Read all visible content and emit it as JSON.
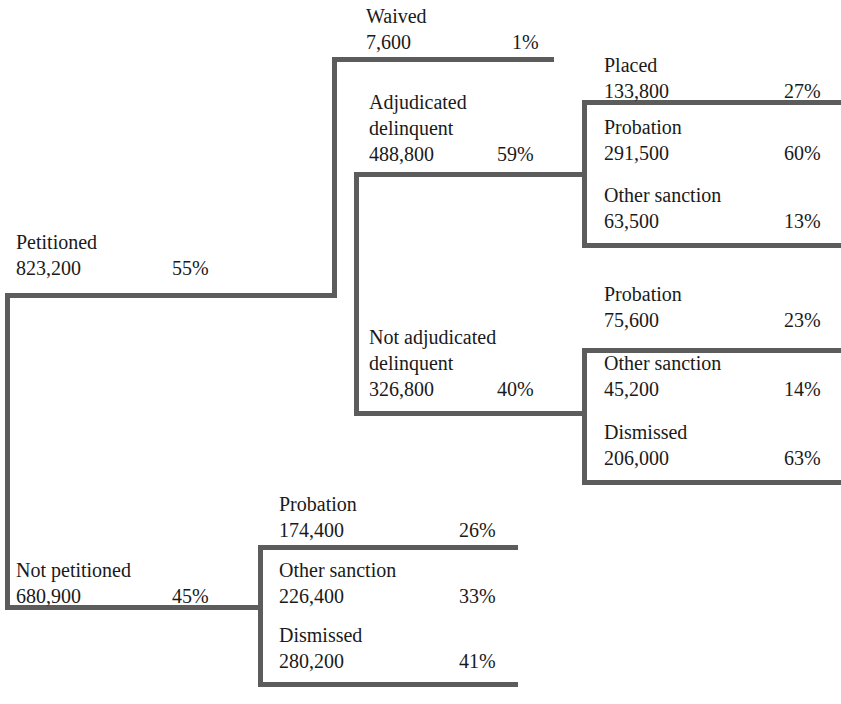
{
  "diagram": {
    "type": "tree-flow",
    "title": "",
    "line_color": "#5c5c5c",
    "text_color": "#1a1a1a",
    "background": "#ffffff"
  },
  "nodes": {
    "petitioned": {
      "label": "Petitioned",
      "count": "823,200",
      "percent": "55%"
    },
    "waived": {
      "label": "Waived",
      "count": "7,600",
      "percent": "1%"
    },
    "adjudicated_delinquent": {
      "label_line1": "Adjudicated",
      "label_line2": "delinquent",
      "count": "488,800",
      "percent": "59%"
    },
    "adj_placed": {
      "label": "Placed",
      "count": "133,800",
      "percent": "27%"
    },
    "adj_probation": {
      "label": "Probation",
      "count": "291,500",
      "percent": "60%"
    },
    "adj_other_sanction": {
      "label": "Other sanction",
      "count": "63,500",
      "percent": "13%"
    },
    "not_adjudicated_delinquent": {
      "label_line1": "Not adjudicated",
      "label_line2": "delinquent",
      "count": "326,800",
      "percent": "40%"
    },
    "notadj_probation": {
      "label": "Probation",
      "count": "75,600",
      "percent": "23%"
    },
    "notadj_other_sanction": {
      "label": "Other sanction",
      "count": "45,200",
      "percent": "14%"
    },
    "notadj_dismissed": {
      "label": "Dismissed",
      "count": "206,000",
      "percent": "63%"
    },
    "not_petitioned": {
      "label": "Not petitioned",
      "count": "680,900",
      "percent": "45%"
    },
    "notpet_probation": {
      "label": "Probation",
      "count": "174,400",
      "percent": "26%"
    },
    "notpet_other_sanction": {
      "label": "Other sanction",
      "count": "226,400",
      "percent": "33%"
    },
    "notpet_dismissed": {
      "label": "Dismissed",
      "count": "280,200",
      "percent": "41%"
    }
  }
}
